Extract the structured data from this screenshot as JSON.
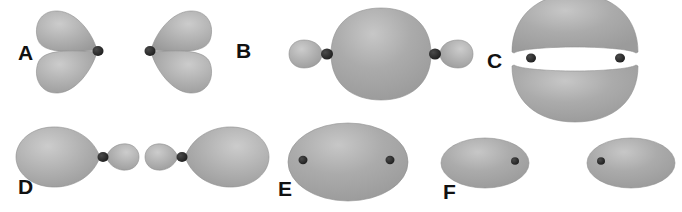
{
  "figure": {
    "background_color": "#ffffff",
    "orbital_fill_color": "#a9a9a9",
    "orbital_highlight_color": "#c9c9c9",
    "orbital_edge_color": "#8f8f8f",
    "nucleus_color": "#2b2b2b",
    "label_color": "#111111"
  },
  "panels": [
    {
      "id": "A",
      "label": "A",
      "label_x": 18,
      "label_y": 42,
      "description": "two p orbitals, each with two teardrop lobes meeting at a nucleus, facing each other",
      "orbital_count": 2,
      "nucleus_count": 2
    },
    {
      "id": "B",
      "label": "B",
      "label_x": 236,
      "label_y": 40,
      "description": "sigma bonding orbital: large central lens with two small outer lobes and two nuclei",
      "orbital_count": 1,
      "nucleus_count": 2
    },
    {
      "id": "C",
      "label": "C",
      "label_x": 487,
      "label_y": 50,
      "description": "pi orbital: two large horizontal lobes above and below two nuclei",
      "orbital_count": 2,
      "nucleus_count": 2
    },
    {
      "id": "D",
      "label": "D",
      "label_x": 18,
      "label_y": 176,
      "description": "two sp hybrid orbitals with small lobes pointing inward toward each other",
      "orbital_count": 2,
      "nucleus_count": 2
    },
    {
      "id": "E",
      "label": "E",
      "label_x": 278,
      "label_y": 178,
      "description": "sigma bonding orbital: single large ellipse enclosing two nuclei",
      "orbital_count": 1,
      "nucleus_count": 2
    },
    {
      "id": "F",
      "label": "F",
      "label_x": 443,
      "label_y": 181,
      "description": "sigma antibonding orbital: two separate ellipses each containing one nucleus",
      "orbital_count": 2,
      "nucleus_count": 2
    }
  ]
}
